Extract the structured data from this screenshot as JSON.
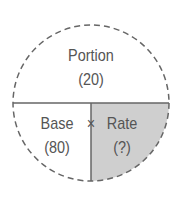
{
  "diagram": {
    "type": "percentage-circle",
    "top": {
      "label": "Portion",
      "value": "(20)"
    },
    "bottom_left": {
      "label": "Base",
      "value": "(80)"
    },
    "bottom_right": {
      "label": "Rate",
      "value": "(?)"
    },
    "operator": "×",
    "colors": {
      "line": "#666666",
      "shade": "#c8c8c8",
      "text": "#555555"
    }
  }
}
